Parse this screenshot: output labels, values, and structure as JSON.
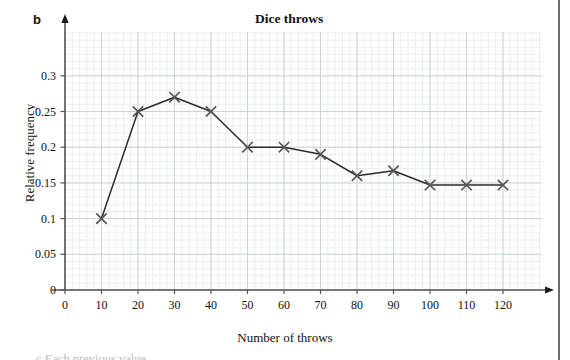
{
  "figure": {
    "panel_letter": "b",
    "title": "Dice throws",
    "caption_partial": "c    Each previous value. ..."
  },
  "axes": {
    "x_title": "Number of throws",
    "y_title": "Relative frequency",
    "x_ticks": [
      "0",
      "10",
      "20",
      "30",
      "40",
      "50",
      "60",
      "70",
      "80",
      "90",
      "100",
      "110",
      "120"
    ],
    "y_ticks": [
      "0",
      "0.05",
      "0.1",
      "0.15",
      "0.2",
      "0.25",
      "0.3"
    ]
  },
  "colors": {
    "line": "#2b2b2b",
    "marker": "#555555",
    "grid_major": "#c9d4d4",
    "grid_minor": "#e8efef",
    "axis": "#555555",
    "page_edge": "#6b6b6b",
    "text": "#111111"
  },
  "chart_data": {
    "type": "line",
    "title": "Dice throws",
    "xlabel": "Number of throws",
    "ylabel": "Relative frequency",
    "xlim": [
      0,
      130
    ],
    "ylim": [
      0,
      0.335
    ],
    "xticks": [
      0,
      10,
      20,
      30,
      40,
      50,
      60,
      70,
      80,
      90,
      100,
      110,
      120
    ],
    "yticks": [
      0,
      0.05,
      0.1,
      0.15,
      0.2,
      0.25,
      0.3
    ],
    "grid": true,
    "minor_grid": true,
    "legend": "none",
    "marker": "x",
    "x": [
      10,
      20,
      30,
      40,
      50,
      60,
      70,
      80,
      90,
      100,
      110,
      120
    ],
    "values": [
      0.1,
      0.25,
      0.27,
      0.25,
      0.2,
      0.2,
      0.19,
      0.16,
      0.167,
      0.147,
      0.147,
      0.147
    ]
  }
}
